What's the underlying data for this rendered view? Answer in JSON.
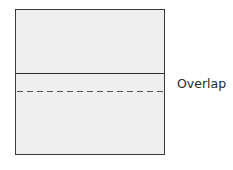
{
  "diagram": {
    "label": "Overlap",
    "colors": {
      "box_fill": "#efefef",
      "border": "#3a3a3a",
      "dashed": "#555555"
    }
  }
}
